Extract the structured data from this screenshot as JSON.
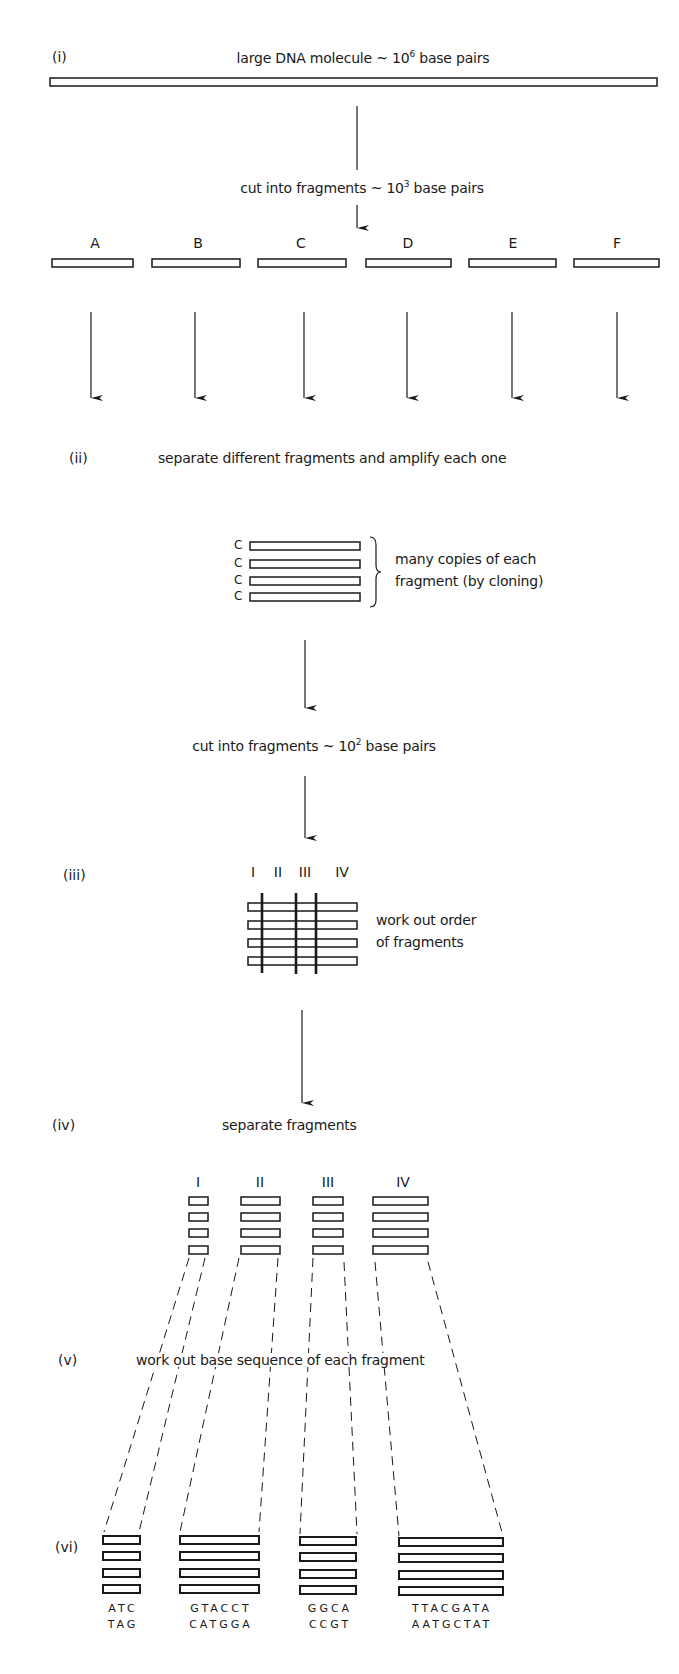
{
  "figure": {
    "steps": [
      {
        "id": "i",
        "label": "(i)",
        "text": "large DNA molecule ~ 10",
        "sup": "6",
        "suffix": " base pairs"
      },
      {
        "id": "cut1",
        "text": "cut into fragments ~ 10",
        "sup": "3",
        "suffix": " base pairs"
      },
      {
        "id": "ii",
        "label": "(ii)",
        "text": "separate different fragments and amplify each one"
      },
      {
        "id": "cut2",
        "text": "cut into fragments ~ 10",
        "sup": "2",
        "suffix": " base pairs"
      },
      {
        "id": "iii",
        "label": "(iii)",
        "text_line1": "work out order",
        "text_line2": "of fragments"
      },
      {
        "id": "iv",
        "label": "(iv)",
        "text": "separate fragments"
      },
      {
        "id": "v",
        "label": "(v)",
        "text": "work out base sequence of each fragment"
      },
      {
        "id": "vi",
        "label": "(vi)"
      }
    ],
    "fragments_large": [
      "A",
      "B",
      "C",
      "D",
      "E",
      "F"
    ],
    "clone_label": "C",
    "clone_count": 4,
    "clone_note_line1": "many copies of each",
    "clone_note_line2": "fragment (by cloning)",
    "subfragments": [
      "I",
      "II",
      "III",
      "IV"
    ],
    "sequences": [
      {
        "fragment": "I",
        "top": "ATC",
        "bottom": "TAG"
      },
      {
        "fragment": "II",
        "top": "GTACCT",
        "bottom": "CATGGA"
      },
      {
        "fragment": "III",
        "top": "GGCA",
        "bottom": "CCGT"
      },
      {
        "fragment": "IV",
        "top": "TTACGATA",
        "bottom": "AATGCTAT"
      }
    ],
    "colors": {
      "ink": "#1a1a1a",
      "background": "#ffffff"
    }
  }
}
